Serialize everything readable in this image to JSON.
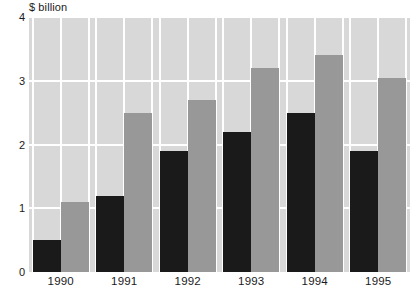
{
  "chart_data": {
    "type": "bar",
    "title": "",
    "subtitle": "",
    "xlabel": "",
    "ylabel": "$ billion",
    "unit_label": "$ billion",
    "categories": [
      "1990",
      "1991",
      "1992",
      "1993",
      "1994",
      "1995"
    ],
    "series": [
      {
        "name": "dark-series",
        "color": "#1a1a1a",
        "values": [
          0.5,
          1.2,
          1.9,
          2.2,
          2.5,
          1.9
        ]
      },
      {
        "name": "light-series",
        "color": "#989898",
        "values": [
          1.1,
          2.5,
          2.7,
          3.2,
          3.4,
          3.05
        ]
      }
    ],
    "ylim": [
      0,
      4
    ],
    "yticks": [
      0,
      1,
      2,
      3,
      4
    ],
    "ytick_labels": [
      "0",
      "1",
      "2",
      "3",
      "4"
    ],
    "grid": true,
    "grid_color": "#ffffff",
    "plot_background": "#d8d8d8",
    "legend": "none",
    "legend_position": "none"
  }
}
